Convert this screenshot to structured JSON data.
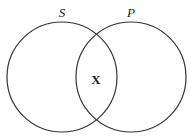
{
  "diagram": {
    "type": "venn",
    "circles": [
      {
        "label": "S",
        "cx": 62,
        "cy": 77,
        "r": 55
      },
      {
        "label": "P",
        "cx": 131,
        "cy": 77,
        "r": 55
      }
    ],
    "intersection_mark": "X",
    "stroke_color": "#333333"
  }
}
